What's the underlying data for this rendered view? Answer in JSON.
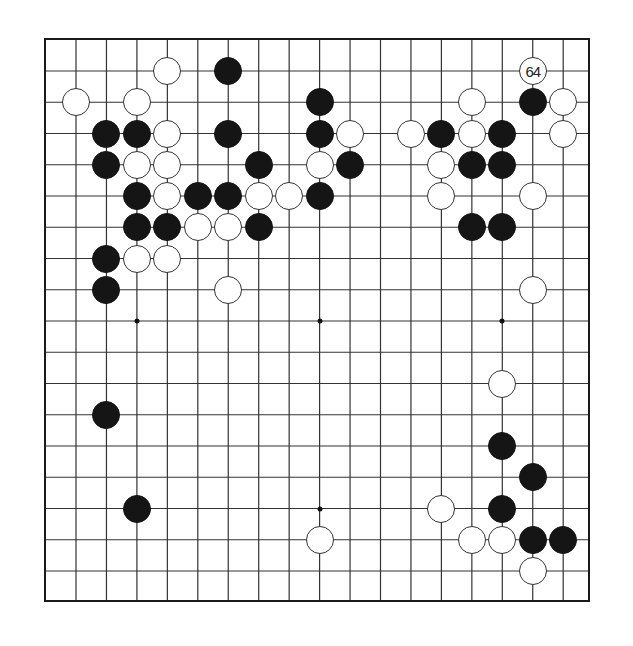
{
  "diagram": {
    "type": "go-board-partial",
    "grid": {
      "columns": 17,
      "rows": 17,
      "origin_x": 74,
      "origin_y": 69,
      "col_spacing": 30.45,
      "row_spacing": 31.25,
      "frame": {
        "left": 44,
        "top": 38,
        "right": 590,
        "bottom": 602
      }
    },
    "colors": {
      "black": "#151515",
      "white": "#ffffff",
      "line": "#333333"
    },
    "star_points": [
      {
        "col": 2,
        "row": 8
      },
      {
        "col": 8,
        "row": 8
      },
      {
        "col": 14,
        "row": 8
      },
      {
        "col": 2,
        "row": 14
      },
      {
        "col": 8,
        "row": 14
      },
      {
        "col": 14,
        "row": 14
      }
    ],
    "stones": [
      {
        "color": "white",
        "col": 3,
        "row": 0
      },
      {
        "color": "black",
        "col": 5,
        "row": 0
      },
      {
        "color": "white",
        "col": 15,
        "row": 0,
        "label": "64"
      },
      {
        "color": "white",
        "col": 0,
        "row": 1
      },
      {
        "color": "white",
        "col": 2,
        "row": 1
      },
      {
        "color": "black",
        "col": 8,
        "row": 1
      },
      {
        "color": "white",
        "col": 13,
        "row": 1
      },
      {
        "color": "black",
        "col": 15,
        "row": 1
      },
      {
        "color": "white",
        "col": 16,
        "row": 1
      },
      {
        "color": "black",
        "col": 1,
        "row": 2
      },
      {
        "color": "black",
        "col": 2,
        "row": 2
      },
      {
        "color": "white",
        "col": 3,
        "row": 2
      },
      {
        "color": "black",
        "col": 5,
        "row": 2
      },
      {
        "color": "black",
        "col": 8,
        "row": 2
      },
      {
        "color": "white",
        "col": 9,
        "row": 2
      },
      {
        "color": "white",
        "col": 11,
        "row": 2
      },
      {
        "color": "black",
        "col": 12,
        "row": 2
      },
      {
        "color": "white",
        "col": 13,
        "row": 2
      },
      {
        "color": "black",
        "col": 14,
        "row": 2
      },
      {
        "color": "white",
        "col": 16,
        "row": 2
      },
      {
        "color": "black",
        "col": 1,
        "row": 3
      },
      {
        "color": "white",
        "col": 2,
        "row": 3
      },
      {
        "color": "white",
        "col": 3,
        "row": 3
      },
      {
        "color": "black",
        "col": 6,
        "row": 3
      },
      {
        "color": "white",
        "col": 8,
        "row": 3
      },
      {
        "color": "black",
        "col": 9,
        "row": 3
      },
      {
        "color": "white",
        "col": 12,
        "row": 3
      },
      {
        "color": "black",
        "col": 13,
        "row": 3
      },
      {
        "color": "black",
        "col": 14,
        "row": 3
      },
      {
        "color": "black",
        "col": 2,
        "row": 4
      },
      {
        "color": "white",
        "col": 3,
        "row": 4
      },
      {
        "color": "black",
        "col": 4,
        "row": 4
      },
      {
        "color": "black",
        "col": 5,
        "row": 4
      },
      {
        "color": "white",
        "col": 6,
        "row": 4
      },
      {
        "color": "white",
        "col": 7,
        "row": 4
      },
      {
        "color": "black",
        "col": 8,
        "row": 4
      },
      {
        "color": "white",
        "col": 12,
        "row": 4
      },
      {
        "color": "white",
        "col": 15,
        "row": 4
      },
      {
        "color": "black",
        "col": 2,
        "row": 5
      },
      {
        "color": "black",
        "col": 3,
        "row": 5
      },
      {
        "color": "white",
        "col": 4,
        "row": 5
      },
      {
        "color": "white",
        "col": 5,
        "row": 5
      },
      {
        "color": "black",
        "col": 6,
        "row": 5
      },
      {
        "color": "black",
        "col": 13,
        "row": 5
      },
      {
        "color": "black",
        "col": 14,
        "row": 5
      },
      {
        "color": "black",
        "col": 1,
        "row": 6
      },
      {
        "color": "white",
        "col": 2,
        "row": 6
      },
      {
        "color": "white",
        "col": 3,
        "row": 6
      },
      {
        "color": "black",
        "col": 1,
        "row": 7
      },
      {
        "color": "white",
        "col": 5,
        "row": 7
      },
      {
        "color": "white",
        "col": 15,
        "row": 7
      },
      {
        "color": "white",
        "col": 14,
        "row": 10
      },
      {
        "color": "black",
        "col": 1,
        "row": 11
      },
      {
        "color": "black",
        "col": 14,
        "row": 12
      },
      {
        "color": "black",
        "col": 15,
        "row": 13
      },
      {
        "color": "black",
        "col": 2,
        "row": 14
      },
      {
        "color": "white",
        "col": 12,
        "row": 14
      },
      {
        "color": "black",
        "col": 14,
        "row": 14
      },
      {
        "color": "white",
        "col": 8,
        "row": 15
      },
      {
        "color": "white",
        "col": 13,
        "row": 15
      },
      {
        "color": "white",
        "col": 14,
        "row": 15
      },
      {
        "color": "black",
        "col": 15,
        "row": 15
      },
      {
        "color": "black",
        "col": 16,
        "row": 15
      },
      {
        "color": "white",
        "col": 15,
        "row": 16
      }
    ]
  }
}
